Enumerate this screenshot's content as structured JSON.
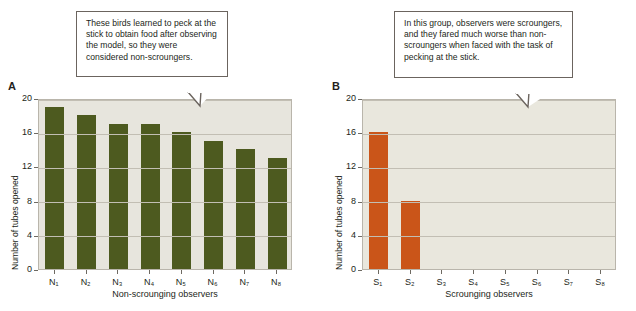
{
  "figure": {
    "panels": [
      {
        "letter": "A",
        "callout": "These birds learned to peck at the stick to obtain food after observing the model, so they were considered non-scroungers.",
        "ylabel": "Number of tubes opened",
        "xlabel": "Non-scrounging observers"
      },
      {
        "letter": "B",
        "callout": "In this group, observers were scroungers, and they fared much worse than non-scroungers when faced with the task of pecking at the stick.",
        "ylabel": "Number of tubes opened",
        "xlabel": "Scrounging observers"
      }
    ]
  },
  "chart_data": [
    {
      "type": "bar",
      "panel": "A",
      "title": "",
      "categories": [
        "N1",
        "N2",
        "N3",
        "N4",
        "N5",
        "N6",
        "N7",
        "N8"
      ],
      "category_labels": [
        "N₁",
        "N₂",
        "N₃",
        "N₄",
        "N₅",
        "N₆",
        "N₇",
        "N₈"
      ],
      "values": [
        19,
        18,
        17,
        17,
        16,
        15,
        14,
        13
      ],
      "xlabel": "Non-scrounging observers",
      "ylabel": "Number of tubes opened",
      "ylim": [
        0,
        20
      ],
      "yticks": [
        0,
        4,
        8,
        12,
        16,
        20
      ],
      "grid": true,
      "legend": "none",
      "bar_color": "#4d5a1f",
      "plot_background": "#e7e5dd"
    },
    {
      "type": "bar",
      "panel": "B",
      "title": "",
      "categories": [
        "S1",
        "S2",
        "S3",
        "S4",
        "S5",
        "S6",
        "S7",
        "S8"
      ],
      "category_labels": [
        "S₁",
        "S₂",
        "S₃",
        "S₄",
        "S₅",
        "S₆",
        "S₇",
        "S₈"
      ],
      "values": [
        16,
        8,
        0,
        0,
        0,
        0,
        0,
        0
      ],
      "xlabel": "Scrounging observers",
      "ylabel": "Number of tubes opened",
      "ylim": [
        0,
        20
      ],
      "yticks": [
        0,
        4,
        8,
        12,
        16,
        20
      ],
      "grid": true,
      "legend": "none",
      "bar_color": "#ca5519",
      "plot_background": "#e9e7dd"
    }
  ]
}
